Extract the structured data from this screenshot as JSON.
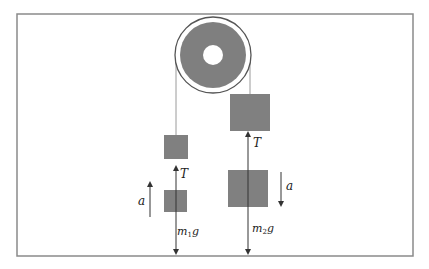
{
  "diagram": {
    "colors": {
      "frame": "#8a8a8a",
      "block_fill": "#808080",
      "pulley_disk": "#7f7f7f",
      "pulley_rim": "#555555",
      "rope": "#9a9a9a",
      "vector": "#333333",
      "background": "#ffffff"
    },
    "frame": {
      "x": 17,
      "y": 14,
      "width": 396,
      "height": 242
    },
    "pulley": {
      "cx": 213,
      "cy": 55,
      "outer_r": 38,
      "disk_r": 33,
      "hole_r": 10
    },
    "ropes": [
      {
        "name": "left-rope",
        "x": 176,
        "y1": 55,
        "y2": 135
      },
      {
        "name": "right-rope",
        "x": 250,
        "y1": 55,
        "y2": 94
      }
    ],
    "blocks": [
      {
        "name": "block-m1-hanging",
        "x": 164,
        "y": 135,
        "w": 24,
        "h": 24
      },
      {
        "name": "block-m1-fbd",
        "x": 164,
        "y": 190,
        "w": 23,
        "h": 22
      },
      {
        "name": "block-m2-hanging",
        "x": 230,
        "y": 94,
        "w": 40,
        "h": 37
      },
      {
        "name": "block-m2-fbd",
        "x": 228,
        "y": 170,
        "w": 40,
        "h": 37
      }
    ],
    "labels": {
      "tension_left": "T",
      "tension_right": "T",
      "weight_left_main": "m",
      "weight_left_sub": "1",
      "weight_left_g": "g",
      "weight_right_main": "m",
      "weight_right_sub": "2",
      "weight_right_g": "g",
      "accel_left": "a",
      "accel_right": "a"
    }
  }
}
